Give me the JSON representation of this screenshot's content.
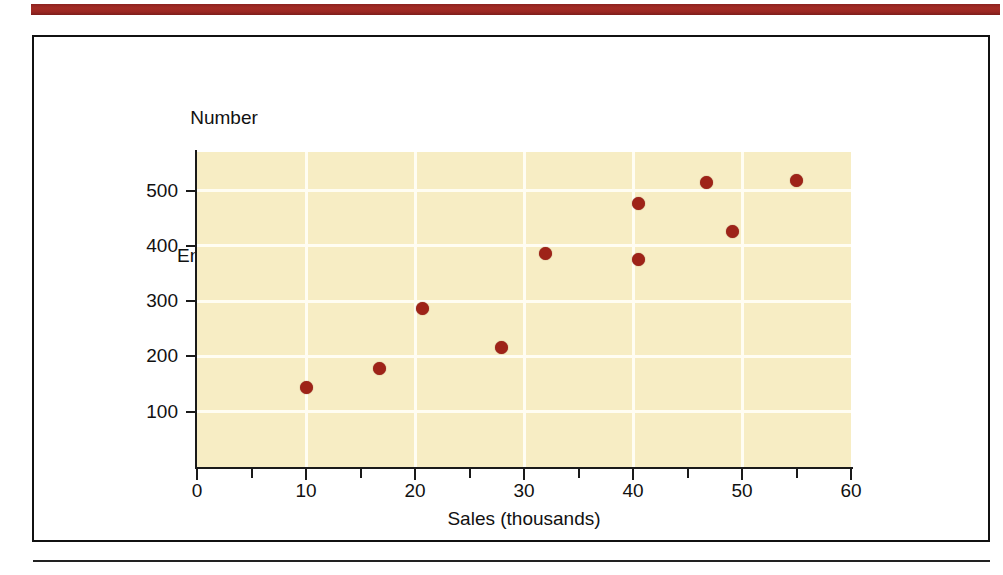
{
  "figure": {
    "banner_color": "#9b2722",
    "frame_color": "#111111",
    "plot_bg_color": "#f7edc4",
    "point_color": "#9e2318",
    "gridline_color": "#fffdf2"
  },
  "chart_data": {
    "type": "scatter",
    "title": "",
    "xlabel": "Sales (thousands)",
    "ylabel": "Number\nof\nEmployees",
    "ylabel_lines": [
      "Number",
      "of",
      "Employees"
    ],
    "xlim": [
      0,
      60
    ],
    "ylim": [
      0,
      570
    ],
    "xticks": [
      0,
      5,
      10,
      15,
      20,
      25,
      30,
      35,
      40,
      45,
      50,
      55,
      60
    ],
    "xticklabels": [
      "0",
      "",
      "10",
      "",
      "20",
      "",
      "30",
      "",
      "40",
      "",
      "50",
      "",
      "60"
    ],
    "yticks": [
      100,
      200,
      300,
      400,
      500
    ],
    "yticklabels": [
      "100",
      "200",
      "300",
      "400",
      "500"
    ],
    "grid": true,
    "grid_axis": "both",
    "legend": false,
    "x": [
      10.0,
      16.7,
      20.7,
      27.9,
      32.0,
      40.5,
      40.5,
      46.7,
      49.1,
      55.0
    ],
    "y": [
      143,
      179,
      286,
      217,
      387,
      476,
      376,
      514,
      427,
      519
    ],
    "points": [
      {
        "x": 10.0,
        "y": 143
      },
      {
        "x": 16.7,
        "y": 179
      },
      {
        "x": 20.7,
        "y": 286
      },
      {
        "x": 27.9,
        "y": 217
      },
      {
        "x": 32.0,
        "y": 387
      },
      {
        "x": 40.5,
        "y": 476
      },
      {
        "x": 40.5,
        "y": 376
      },
      {
        "x": 46.7,
        "y": 514
      },
      {
        "x": 49.1,
        "y": 427
      },
      {
        "x": 55.0,
        "y": 519
      }
    ]
  }
}
